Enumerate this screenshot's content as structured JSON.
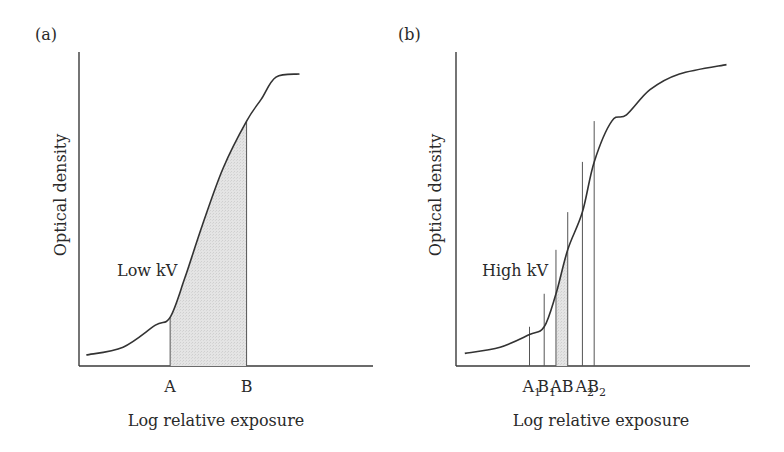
{
  "chart_data": [
    {
      "type": "line",
      "panel_label": "(a)",
      "xlabel": "Log relative exposure",
      "ylabel": "Optical density",
      "curve_label": "Low kV",
      "grid": false,
      "xlim": [
        0,
        10
      ],
      "ylim": [
        0,
        10
      ],
      "curve": {
        "name": "Low kV",
        "x": [
          0.25,
          1.5,
          2.6,
          3.1,
          3.6,
          4.2,
          4.9,
          5.7,
          6.2,
          6.7,
          7.5
        ],
        "y": [
          0.35,
          0.6,
          1.3,
          1.55,
          2.8,
          4.5,
          6.3,
          7.8,
          8.5,
          9.2,
          9.3
        ]
      },
      "markers": [
        {
          "label": "A",
          "sub": "",
          "x": 3.1,
          "y": 1.55
        },
        {
          "label": "B",
          "sub": "",
          "x": 5.7,
          "y": 7.8
        }
      ],
      "shaded_region": {
        "from": "A",
        "to": "B"
      }
    },
    {
      "type": "line",
      "panel_label": "(b)",
      "xlabel": "Log relative exposure",
      "ylabel": "Optical density",
      "curve_label": "High kV",
      "grid": false,
      "xlim": [
        0,
        10
      ],
      "ylim": [
        0,
        10
      ],
      "curve": {
        "name": "High kV",
        "x": [
          0.3,
          1.5,
          2.5,
          3.0,
          3.4,
          3.8,
          4.3,
          4.7,
          5.3,
          5.8,
          6.6,
          7.6,
          9.2
        ],
        "y": [
          0.4,
          0.6,
          1.0,
          1.25,
          2.3,
          3.7,
          4.9,
          6.5,
          7.8,
          8.0,
          8.8,
          9.3,
          9.6
        ]
      },
      "markers": [
        {
          "label": "A",
          "sub": "1",
          "x": 2.5,
          "y": 1.25
        },
        {
          "label": "B",
          "sub": "1",
          "x": 3.0,
          "y": 2.3
        },
        {
          "label": "A",
          "sub": "",
          "x": 3.4,
          "y": 3.7
        },
        {
          "label": "B",
          "sub": "",
          "x": 3.8,
          "y": 4.9
        },
        {
          "label": "A",
          "sub": "2",
          "x": 4.3,
          "y": 6.5
        },
        {
          "label": "B",
          "sub": "2",
          "x": 4.7,
          "y": 7.8
        }
      ],
      "shaded_region": {
        "from": "A",
        "to": "B"
      }
    }
  ]
}
